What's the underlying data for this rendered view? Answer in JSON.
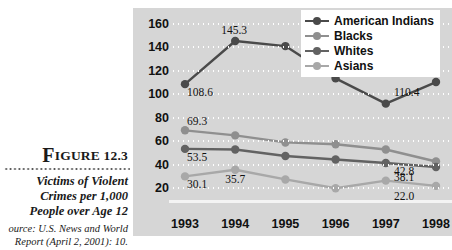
{
  "figure": {
    "dropcap": "F",
    "label": "IGURE 12.3",
    "caption_line1": "Victims of Violent",
    "caption_line2": "Crimes per 1,000",
    "caption_line3": "People over Age 12",
    "source_line1": "ource: U.S. News and World",
    "source_line2": "Report (April 2, 2001): 10."
  },
  "colors": {
    "panel_background": "#d6d6d6",
    "gridline": "#ffffff",
    "american_indians": "#4a4a4a",
    "blacks": "#8f8f8f",
    "whites": "#626262",
    "asians": "#a8a8a8",
    "text": "#111111"
  },
  "chart_data": {
    "type": "line",
    "title": "Victims of Violent Crimes per 1,000 People over Age 12",
    "xlabel": "",
    "ylabel": "",
    "categories": [
      "1993",
      "1994",
      "1995",
      "1996",
      "1997",
      "1998"
    ],
    "ylim": [
      10,
      170
    ],
    "yticks": [
      20,
      40,
      60,
      80,
      100,
      120,
      140,
      160
    ],
    "grid": true,
    "legend_position": "top-right",
    "series": [
      {
        "name": "American Indians",
        "color": "#4a4a4a",
        "values": [
          108.6,
          145.3,
          141.0,
          113.5,
          92.0,
          110.4
        ],
        "labels": {
          "1993": "108.6",
          "1994": "145.3",
          "1998": "110.4"
        }
      },
      {
        "name": "Blacks",
        "color": "#8f8f8f",
        "values": [
          69.3,
          65.0,
          59.0,
          57.5,
          53.0,
          42.8
        ],
        "labels": {
          "1993": "69.3",
          "1998": "42.8"
        }
      },
      {
        "name": "Whites",
        "color": "#626262",
        "values": [
          53.5,
          53.0,
          47.5,
          44.5,
          41.5,
          38.1
        ],
        "labels": {
          "1993": "53.5",
          "1998": "38.1"
        }
      },
      {
        "name": "Asians",
        "color": "#a8a8a8",
        "values": [
          30.1,
          35.7,
          27.5,
          20.0,
          26.5,
          22.0
        ],
        "labels": {
          "1993": "30.1",
          "1994": "35.7",
          "1998": "22.0"
        }
      }
    ]
  }
}
